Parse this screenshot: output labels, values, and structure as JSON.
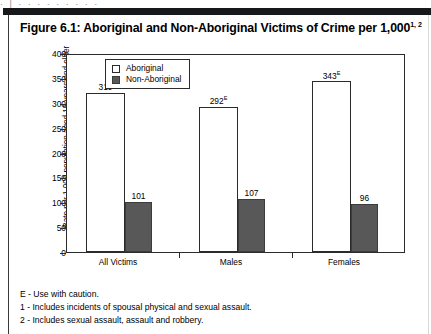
{
  "page": {
    "top_partial_text": "·  |   ·        ·          ·      ·     ·  ·        ·       ·   ·"
  },
  "figure": {
    "title": "Figure 6.1: Aboriginal and Non-Aboriginal Victims of Crime per 1,000",
    "title_superscript": "1, 2"
  },
  "legend": {
    "items": [
      {
        "label": "Aboriginal",
        "color": "#ffffff",
        "swatch": "hollow-square"
      },
      {
        "label": "Non-Aboriginal",
        "color": "#585858",
        "swatch": "filled-square"
      }
    ]
  },
  "footnotes": [
    "E - Use with caution.",
    "1 - Includes incidents of spousal physical and sexual assault.",
    "2 - Includes sexual assault, assault and robbery."
  ],
  "chart_data": {
    "type": "bar",
    "title": "Figure 6.1: Aboriginal and Non-Aboriginal Victims of Crime per 1,000",
    "categories": [
      "All Victims",
      "Males",
      "Females"
    ],
    "series": [
      {
        "name": "Aboriginal",
        "color": "#ffffff",
        "values": [
          319,
          292,
          343
        ],
        "value_labels": [
          "319",
          "292",
          "343"
        ],
        "value_flags": [
          "",
          "E",
          "E"
        ]
      },
      {
        "name": "Non-Aboriginal",
        "color": "#585858",
        "values": [
          101,
          107,
          96
        ],
        "value_labels": [
          "101",
          "107",
          "96"
        ],
        "value_flags": [
          "",
          "",
          ""
        ]
      }
    ],
    "xlabel": "",
    "ylabel": "Rate per 1,000 population aged 15 years and older",
    "ylim": [
      0,
      400
    ],
    "yticks": [
      0,
      50,
      100,
      150,
      200,
      250,
      300,
      350,
      400
    ],
    "ytick_labels": [
      "0",
      "50",
      "100",
      "150",
      "200",
      "250",
      "300",
      "350",
      "400"
    ],
    "grid": false,
    "legend_position": "top-left-inside"
  }
}
